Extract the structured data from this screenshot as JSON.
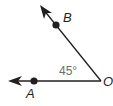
{
  "diagram": {
    "type": "angle",
    "vertex": {
      "label": "O",
      "x": 101,
      "y": 81
    },
    "rays": [
      {
        "name": "OA",
        "point_label": "A",
        "point": {
          "x": 34,
          "y": 81
        },
        "end": {
          "x": 9,
          "y": 81
        }
      },
      {
        "name": "OB",
        "point_label": "B",
        "point": {
          "x": 56,
          "y": 25
        },
        "end": {
          "x": 41,
          "y": 7
        }
      }
    ],
    "angle_measure": "45°",
    "colors": {
      "line": "#231f20",
      "angle_text": "#6d6e71"
    }
  }
}
